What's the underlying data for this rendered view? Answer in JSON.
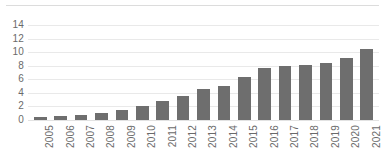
{
  "chart_data": {
    "type": "bar",
    "title": "",
    "subtitle": "",
    "xlabel": "",
    "ylabel": "",
    "categories": [
      "2005",
      "2006",
      "2007",
      "2008",
      "2009",
      "2010",
      "2011",
      "2012",
      "2013",
      "2014",
      "2015",
      "2016",
      "2017",
      "2018",
      "2019",
      "2020",
      "2021"
    ],
    "values": [
      0.5,
      0.6,
      0.8,
      1.1,
      1.5,
      2.0,
      2.8,
      3.6,
      4.5,
      5.0,
      6.4,
      7.6,
      7.9,
      8.1,
      8.4,
      9.1,
      10.5
    ],
    "ylim": [
      0,
      14
    ],
    "y_ticks": [
      0,
      2,
      4,
      6,
      8,
      10,
      12,
      14
    ],
    "grid": true,
    "legend": null,
    "legend_position": "none",
    "annotations": [],
    "colors": {
      "bar": "#6e6e6e",
      "gridline": "#e9e9e9",
      "axis_text": "#6a6a6a",
      "background": "#ffffff",
      "top_rule": "#dcdcdc"
    }
  }
}
